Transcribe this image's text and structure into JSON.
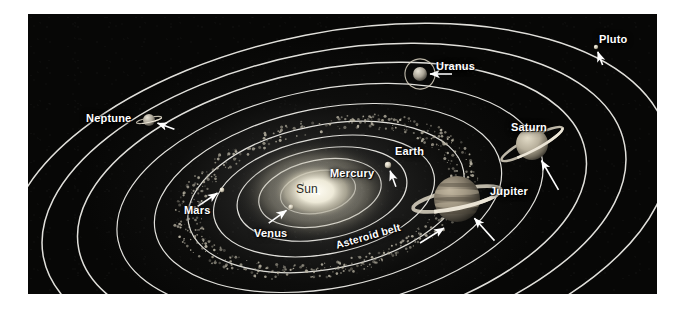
{
  "figure": {
    "kind": "solar-system-diagram",
    "caption": "",
    "plate_background": "#080807",
    "orbit_line_color": "#f2f1ec",
    "label_color": "#ffffff",
    "sun_label_color": "#2a2a26"
  },
  "sun": {
    "label": "Sun",
    "label_x": 296,
    "label_y": 183,
    "center_x": 316,
    "center_y": 191,
    "radius_x": 46,
    "radius_y": 30,
    "color": "#f6f3e4"
  },
  "asteroid_belt": {
    "label": "Asteroid belt",
    "label_x": 336,
    "label_y": 240,
    "rotation_deg": -16,
    "arrow": true,
    "color": "#b9b4a4"
  },
  "planets": [
    {
      "name": "Mercury",
      "label": "Mercury",
      "label_x": 330,
      "label_y": 168,
      "body_x": 302,
      "body_y": 184,
      "body_r": 2.0,
      "color": "#cfc9b8",
      "arrow": true,
      "arrow_angle_deg": 210,
      "arrow_len": 16,
      "rings": false
    },
    {
      "name": "Venus",
      "label": "Venus",
      "label_x": 254,
      "label_y": 228,
      "body_x": 291,
      "body_y": 207,
      "body_r": 2.6,
      "color": "#ded6c0",
      "arrow": true,
      "arrow_angle_deg": -36,
      "arrow_len": 22,
      "rings": false
    },
    {
      "name": "Earth",
      "label": "Earth",
      "label_x": 395,
      "label_y": 146,
      "body_x": 388,
      "body_y": 165,
      "body_r": 3.2,
      "color": "#d8d2c2",
      "arrow": true,
      "arrow_angle_deg": 250,
      "arrow_len": 17,
      "rings": false
    },
    {
      "name": "Mars",
      "label": "Mars",
      "label_x": 184,
      "label_y": 205,
      "body_x": 222,
      "body_y": 190,
      "body_r": 2.4,
      "color": "#cdc4b0",
      "arrow": true,
      "arrow_angle_deg": -34,
      "arrow_len": 24,
      "rings": false
    },
    {
      "name": "Jupiter",
      "label": "Jupiter",
      "label_x": 490,
      "label_y": 186,
      "body_x": 457,
      "body_y": 199,
      "body_r": 23,
      "color": "#8d8474",
      "arrow": true,
      "arrow_angle_deg": 228,
      "arrow_len": 30,
      "rings": true
    },
    {
      "name": "Saturn",
      "label": "Saturn",
      "label_x": 511,
      "label_y": 122,
      "body_x": 532,
      "body_y": 144,
      "body_r": 16,
      "color": "#cfc7b4",
      "arrow": true,
      "arrow_angle_deg": 240,
      "arrow_len": 34,
      "rings": true
    },
    {
      "name": "Uranus",
      "label": "Uranus",
      "label_x": 436,
      "label_y": 61,
      "body_x": 420,
      "body_y": 74,
      "body_r": 7,
      "color": "#c3bcae",
      "arrow": true,
      "arrow_angle_deg": 180,
      "arrow_len": 22,
      "rings": true
    },
    {
      "name": "Neptune",
      "label": "Neptune",
      "label_x": 86,
      "label_y": 113,
      "body_x": 149,
      "body_y": 120,
      "body_r": 6,
      "color": "#b5afa2",
      "arrow": true,
      "arrow_angle_deg": 200,
      "arrow_len": 18,
      "rings": true
    },
    {
      "name": "Pluto",
      "label": "Pluto",
      "label_x": 599,
      "label_y": 34,
      "body_x": 596,
      "body_y": 47,
      "body_r": 2.2,
      "color": "#e4dfd0",
      "arrow": true,
      "arrow_angle_deg": 250,
      "arrow_len": 14,
      "rings": false
    }
  ],
  "orbits": [
    {
      "planet": "Mercury",
      "cx": 318,
      "cy": 192,
      "rx": 38,
      "ry": 21,
      "rot": -11
    },
    {
      "planet": "Venus",
      "cx": 320,
      "cy": 193,
      "rx": 62,
      "ry": 33,
      "rot": -11
    },
    {
      "planet": "Earth",
      "cx": 322,
      "cy": 194,
      "rx": 86,
      "ry": 45,
      "rot": -11
    },
    {
      "planet": "Mars",
      "cx": 324,
      "cy": 196,
      "rx": 112,
      "ry": 58,
      "rot": -11
    },
    {
      "planet": "Asteroid belt",
      "cx": 326,
      "cy": 197,
      "rx": 140,
      "ry": 72,
      "rot": -11
    },
    {
      "planet": "Jupiter",
      "cx": 328,
      "cy": 198,
      "rx": 176,
      "ry": 90,
      "rot": -11
    },
    {
      "planet": "Saturn",
      "cx": 330,
      "cy": 199,
      "rx": 216,
      "ry": 110,
      "rot": -11
    },
    {
      "planet": "Uranus",
      "cx": 332,
      "cy": 200,
      "rx": 258,
      "ry": 131,
      "rot": -11
    },
    {
      "planet": "Neptune",
      "cx": 334,
      "cy": 201,
      "rx": 296,
      "ry": 150,
      "rot": -11
    },
    {
      "planet": "Pluto",
      "cx": 338,
      "cy": 203,
      "rx": 336,
      "ry": 171,
      "rot": -11
    }
  ]
}
